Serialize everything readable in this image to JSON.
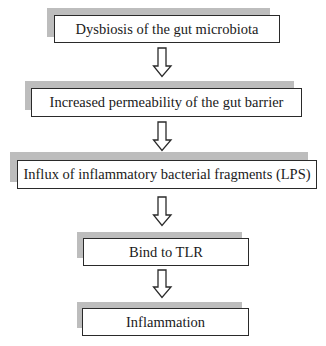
{
  "diagram": {
    "type": "flowchart",
    "direction": "top-to-bottom",
    "colors": {
      "box_border": "#2a2a2a",
      "shadow": "#bdbdbd",
      "arrow_stroke": "#2a2a2a",
      "background": "#ffffff"
    },
    "nodes": [
      {
        "id": "n1",
        "label": "Dysbiosis of the gut microbiota"
      },
      {
        "id": "n2",
        "label": "Increased permeability of the gut barrier"
      },
      {
        "id": "n3",
        "label": "Influx of inflammatory bacterial fragments (LPS)"
      },
      {
        "id": "n4",
        "label": "Bind to TLR"
      },
      {
        "id": "n5",
        "label": "Inflammation"
      }
    ],
    "edges": [
      {
        "from": "n1",
        "to": "n2",
        "style": "hollow-block-arrow"
      },
      {
        "from": "n2",
        "to": "n3",
        "style": "hollow-block-arrow"
      },
      {
        "from": "n3",
        "to": "n4",
        "style": "hollow-block-arrow"
      },
      {
        "from": "n4",
        "to": "n5",
        "style": "hollow-block-arrow"
      }
    ]
  }
}
